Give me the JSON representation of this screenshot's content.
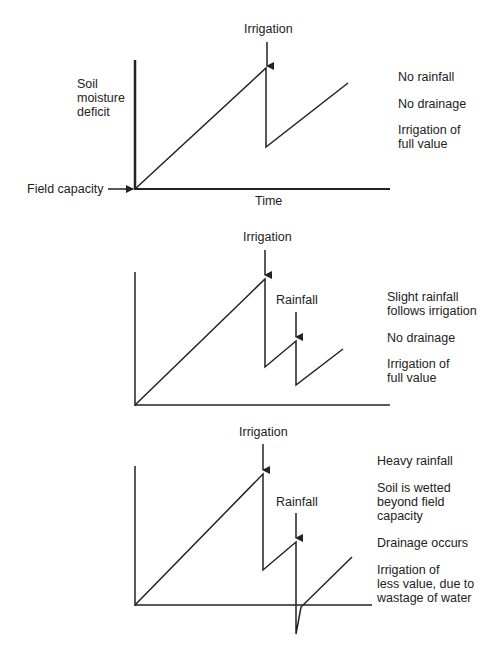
{
  "panels": [
    {
      "event_labels": {
        "irrigation": "Irrigation"
      },
      "y_axis_label": "Soil moisture deficit",
      "y_axis_lines": [
        "Soil",
        "moisture",
        "deficit"
      ],
      "origin_label": "Field capacity",
      "x_axis_label": "Time",
      "notes": [
        "No rainfall",
        "No drainage",
        "Irrigation of full value"
      ],
      "notes_lines": [
        [
          "No rainfall"
        ],
        [
          "No drainage"
        ],
        [
          "Irrigation of",
          "full value"
        ]
      ]
    },
    {
      "event_labels": {
        "irrigation": "Irrigation",
        "rainfall": "Rainfall"
      },
      "notes": [
        "Slight rainfall follows irrigation",
        "No drainage",
        "Irrigation of full value"
      ],
      "notes_lines": [
        [
          "Slight rainfall",
          "follows irrigation"
        ],
        [
          "No drainage"
        ],
        [
          "Irrigation of",
          "full value"
        ]
      ]
    },
    {
      "event_labels": {
        "irrigation": "Irrigation",
        "rainfall": "Rainfall"
      },
      "notes": [
        "Heavy rainfall",
        "Soil is wetted beyond field capacity",
        "Drainage occurs",
        "Irrigation of less value, due to wastage of water"
      ],
      "notes_lines": [
        [
          "Heavy rainfall"
        ],
        [
          "Soil is wetted",
          "beyond field",
          "capacity"
        ],
        [
          "Drainage occurs"
        ],
        [
          "Irrigation of",
          "less value, due to",
          "wastage of water"
        ]
      ]
    }
  ],
  "colors": {
    "line": "#222222",
    "background": "#ffffff"
  }
}
